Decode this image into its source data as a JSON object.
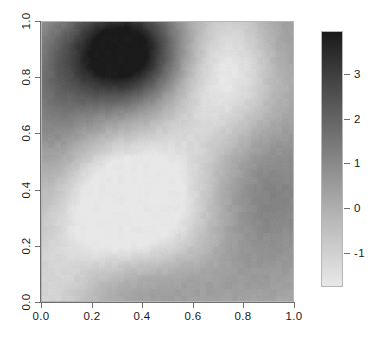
{
  "chart_data": {
    "type": "heatmap",
    "title": "",
    "xlabel": "",
    "ylabel": "",
    "xlim": [
      0.0,
      1.0
    ],
    "ylim": [
      0.0,
      1.0
    ],
    "zlim": [
      -1.75,
      3.95
    ],
    "grid": false,
    "colormap": "grayscale-reversed",
    "colormap_low_hex": "#e8e8e8",
    "colormap_high_hex": "#1a1a1a",
    "legend_position": "right",
    "x_ticks": [
      0.0,
      0.2,
      0.4,
      0.6,
      0.8,
      1.0
    ],
    "x_tick_labels": [
      "0.0",
      "0.2",
      "0.4",
      "0.6",
      "0.8",
      "1.0"
    ],
    "y_ticks": [
      0.0,
      0.2,
      0.4,
      0.6,
      0.8,
      1.0
    ],
    "y_tick_labels": [
      "0.0",
      "0.2",
      "0.4",
      "0.6",
      "0.8",
      "1.0"
    ],
    "legend_ticks": [
      -1,
      0,
      1,
      2,
      3
    ],
    "legend_tick_labels": [
      "-1",
      "0",
      "1",
      "2",
      "3"
    ],
    "nx": 40,
    "ny": 40,
    "x": [
      0.0125,
      0.0375,
      0.0625,
      0.0875,
      0.1125,
      0.1375,
      0.1625,
      0.1875,
      0.2125,
      0.2375,
      0.2625,
      0.2875,
      0.3125,
      0.3375,
      0.3625,
      0.3875,
      0.4125,
      0.4375,
      0.4625,
      0.4875,
      0.5125,
      0.5375,
      0.5625,
      0.5875,
      0.6125,
      0.6375,
      0.6625,
      0.6875,
      0.7125,
      0.7375,
      0.7625,
      0.7875,
      0.8125,
      0.8375,
      0.8625,
      0.8875,
      0.9125,
      0.9375,
      0.9625,
      0.9875
    ],
    "y": [
      0.0125,
      0.0375,
      0.0625,
      0.0875,
      0.1125,
      0.1375,
      0.1625,
      0.1875,
      0.2125,
      0.2375,
      0.2625,
      0.2875,
      0.3125,
      0.3375,
      0.3625,
      0.3875,
      0.4125,
      0.4375,
      0.4625,
      0.4875,
      0.5125,
      0.5375,
      0.5625,
      0.5875,
      0.6125,
      0.6375,
      0.6625,
      0.6875,
      0.7125,
      0.7375,
      0.7625,
      0.7875,
      0.8125,
      0.8375,
      0.8625,
      0.8875,
      0.9125,
      0.9375,
      0.9625,
      0.9875
    ],
    "field_description": "Smooth two-dimensional random field (Gaussian process realisation) over the unit square. A strong dark maximum (z up to about 3.9) is centred near x=0.33, y=0.90. A broad light minimum (z about -1.6) occupies the centre-left near x=0.30, y=0.35. A secondary mid-grey band lies along the bottom edge near y=0.08 and a medium-grey region fills the right-hand side for x greater than 0.63, below y=0.55.",
    "peaks": [
      {
        "x": 0.33,
        "y": 0.9,
        "z": 3.9,
        "label": "primary maximum"
      },
      {
        "x": 0.08,
        "y": 0.98,
        "z": 0.7,
        "label": "upper-left shoulder"
      },
      {
        "x": 0.88,
        "y": 0.42,
        "z": 0.95,
        "label": "right-side ridge"
      },
      {
        "x": 0.35,
        "y": 0.07,
        "z": 0.6,
        "label": "lower band"
      }
    ],
    "troughs": [
      {
        "x": 0.3,
        "y": 0.33,
        "z": -1.7,
        "label": "central minimum"
      },
      {
        "x": 0.72,
        "y": 0.78,
        "z": -1.2,
        "label": "upper-right minimum"
      },
      {
        "x": 0.02,
        "y": 0.05,
        "z": -1.0,
        "label": "lower-left corner"
      }
    ],
    "gaussian_components": [
      {
        "amp": 4.3,
        "cx": 0.33,
        "cy": 0.9,
        "sx": 0.15,
        "sy": 0.12
      },
      {
        "amp": 1.6,
        "cx": 0.18,
        "cy": 0.8,
        "sx": 0.22,
        "sy": 0.18
      },
      {
        "amp": -2.3,
        "cx": 0.3,
        "cy": 0.34,
        "sx": 0.22,
        "sy": 0.2
      },
      {
        "amp": -1.7,
        "cx": 0.73,
        "cy": 0.8,
        "sx": 0.15,
        "sy": 0.18
      },
      {
        "amp": 1.5,
        "cx": 0.88,
        "cy": 0.4,
        "sx": 0.18,
        "sy": 0.22
      },
      {
        "amp": 1.2,
        "cx": 0.38,
        "cy": 0.06,
        "sx": 0.25,
        "sy": 0.1
      },
      {
        "amp": -1.1,
        "cx": 0.03,
        "cy": 0.04,
        "sx": 0.14,
        "sy": 0.12
      },
      {
        "amp": 0.8,
        "cx": 0.05,
        "cy": 0.55,
        "sx": 0.1,
        "sy": 0.22
      },
      {
        "amp": 0.7,
        "cx": 0.98,
        "cy": 0.95,
        "sx": 0.1,
        "sy": 0.14
      },
      {
        "amp": -0.6,
        "cx": 0.55,
        "cy": 0.45,
        "sx": 0.18,
        "sy": 0.22
      }
    ],
    "base_level": -0.25
  }
}
